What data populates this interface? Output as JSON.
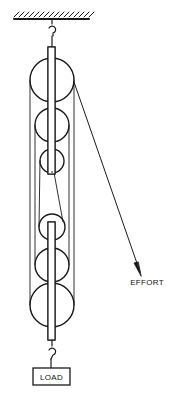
{
  "diagram": {
    "labels": {
      "effort": "EFFORT",
      "load": "LOAD"
    },
    "colors": {
      "stroke": "#1a1a1a",
      "background": "#ffffff"
    },
    "upper_block": {
      "pulleys": [
        {
          "cx": 52,
          "cy": 80,
          "r": 22
        },
        {
          "cx": 52,
          "cy": 125,
          "r": 17
        },
        {
          "cx": 52,
          "cy": 161,
          "r": 12
        }
      ]
    },
    "lower_block": {
      "pulleys": [
        {
          "cx": 52,
          "cy": 227,
          "r": 13
        },
        {
          "cx": 52,
          "cy": 265,
          "r": 17
        },
        {
          "cx": 52,
          "cy": 305,
          "r": 22
        }
      ]
    }
  }
}
